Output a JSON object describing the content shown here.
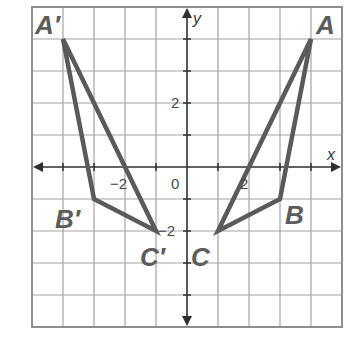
{
  "figure": {
    "type": "coordinate-plane-reflection",
    "axes": {
      "x_label": "x",
      "y_label": "y",
      "x_range": [
        -5,
        5
      ],
      "y_range": [
        -5,
        5
      ],
      "grid_step": 1,
      "tick_labels": {
        "x_neg2": "−2",
        "x_pos2": "2",
        "origin": "0",
        "y_pos2": "2",
        "y_neg2": "−2"
      }
    },
    "triangles": [
      {
        "name": "ABC",
        "vertices": [
          {
            "label": "A",
            "x": 4,
            "y": 4
          },
          {
            "label": "B",
            "x": 3,
            "y": -1
          },
          {
            "label": "C",
            "x": 1,
            "y": -2
          }
        ]
      },
      {
        "name": "A'B'C'",
        "vertices": [
          {
            "label": "A′",
            "x": -4,
            "y": 4
          },
          {
            "label": "B′",
            "x": -3,
            "y": -1
          },
          {
            "label": "C′",
            "x": -1,
            "y": -2
          }
        ]
      }
    ],
    "colors": {
      "grid": "#a3a3a3",
      "axes": "#2f2f2f",
      "triangle_stroke": "#5a5a5a",
      "labels": "#5c5c5c"
    }
  }
}
